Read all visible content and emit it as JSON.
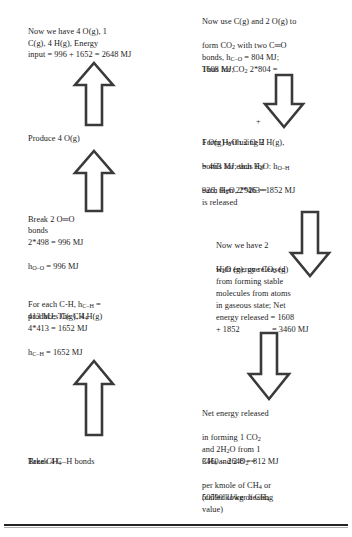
{
  "document": {
    "type": "bond-energy-flowchart",
    "page_background": "#ffffff",
    "ink_color": "#1d1d1d"
  },
  "left_column": {
    "blocks": [
      {
        "id": "energy-input-summary",
        "text": "Now we have 4 O(g), 1\nC(g), 4 H(g), Energy\ninput = 996 + 1652 = 2648 MJ"
      },
      {
        "id": "produce-oxygen",
        "text": "Produce 4 O(g)"
      },
      {
        "id": "break-oo-bonds-line1",
        "text": "Break 2 O═O"
      },
      {
        "id": "break-oo-bonds-line2",
        "text": "bonds"
      },
      {
        "id": "break-oo-bonds-line3",
        "text": "2*498 = 996 MJ"
      },
      {
        "id": "break-oo-bonds-line4",
        "text": "h",
        "subscript": "O–O",
        "tail": " = 996 MJ"
      },
      {
        "id": "ch-bond-line1a",
        "text": "For each C-H, h",
        "subscript": "C–H",
        "tail": " ="
      },
      {
        "id": "ch-bond-line2",
        "text": "413 MJ; The CH",
        "subscript": "4"
      },
      {
        "id": "ch-bond-line3",
        "text": "produces C(g), 4 H(g)"
      },
      {
        "id": "ch-bond-line4",
        "text": "4*413 = 1652 MJ"
      },
      {
        "id": "ch-bond-line5",
        "text": "h",
        "subscript": "C–H",
        "tail": " = 1652 MJ"
      },
      {
        "id": "take-methane-line1",
        "text": "Take CH",
        "subscript": "4"
      },
      {
        "id": "take-methane-line2",
        "text": "Break 4 C–H bonds"
      }
    ]
  },
  "right_column": {
    "blocks": [
      {
        "id": "form-co2-line1",
        "text": "Now use C(g) and 2 O(g) to"
      },
      {
        "id": "form-co2-line2",
        "text": "form CO",
        "subscript": "2",
        "tail": " with two C═O"
      },
      {
        "id": "form-co2-line3",
        "text": "bonds, h",
        "subscript": "C–O",
        "tail": " = 804 MJ;"
      },
      {
        "id": "form-co2-line4",
        "text": "Thus for CO",
        "subscript": "2",
        "tail": " 2*804 ="
      },
      {
        "id": "form-co2-line5",
        "text": "1608 MJ;"
      },
      {
        "id": "form-water-line1",
        "text": "Form H",
        "subscript": "2",
        "tail": "O using 2 H(g),"
      },
      {
        "id": "form-water-line2",
        "text": "1 O(g) with 2 O-H"
      },
      {
        "id": "form-water-line3",
        "text": "bonds for each H",
        "subscript": "2",
        "tail": "O: h",
        "subscript2": "O–H"
      },
      {
        "id": "form-water-line4",
        "text": "= 463 MJ; thus for"
      },
      {
        "id": "form-water-line5",
        "text": "each H",
        "subscript": "2",
        "tail": "O, 2*463 ="
      },
      {
        "id": "form-water-line6",
        "text": "926; then 2*926 = 1852 MJ"
      },
      {
        "id": "form-water-line7",
        "text": "is released"
      },
      {
        "id": "net-release-line1",
        "text": "Now we have 2"
      },
      {
        "id": "net-release-line2",
        "text": "H",
        "subscript": "2",
        "tail": "O (g), one CO",
        "subscript2": "2",
        "tail2": " (g)"
      },
      {
        "id": "net-release-line3",
        "text": "with energy released"
      },
      {
        "id": "net-release-line4",
        "text": "from forming stable"
      },
      {
        "id": "net-release-line5",
        "text": "molecules from atoms"
      },
      {
        "id": "net-release-line6",
        "text": "in gaseous state; Net"
      },
      {
        "id": "net-release-line7",
        "text": "energy released = 1608"
      },
      {
        "id": "net-release-line8-left",
        "text": "+ 1852"
      },
      {
        "id": "net-release-line8-right",
        "text": "= 3460 MJ"
      },
      {
        "id": "lhv-line1",
        "text": "Net energy released"
      },
      {
        "id": "lhv-line2",
        "text": "in forming 1 CO",
        "subscript": "2"
      },
      {
        "id": "lhv-line3",
        "text": "and 2H",
        "subscript": "2",
        "tail": "O from 1"
      },
      {
        "id": "lhv-line4",
        "text": "CH",
        "subscript": "4",
        "tail": " and 2 O",
        "subscript2": "2",
        "tail2": " ="
      },
      {
        "id": "lhv-line5",
        "text": "3460 – 2648 = 812 MJ"
      },
      {
        "id": "lhv-line6",
        "text": "per kmole of CH",
        "subscript": "4",
        "tail": " or"
      },
      {
        "id": "lhv-line7",
        "text": "50590 kJ/kg of CH",
        "subscript": "4"
      },
      {
        "id": "lhv-line8",
        "text": "(called lower heating"
      },
      {
        "id": "lhv-line9",
        "text": "value)"
      }
    ],
    "plus_sign": "+"
  },
  "arrows": {
    "left": [
      {
        "id": "arrow-up-energy-input",
        "direction": "up"
      },
      {
        "id": "arrow-up-produce-oxygen",
        "direction": "up"
      },
      {
        "id": "arrow-up-break-ch-bonds",
        "direction": "up"
      }
    ],
    "right": [
      {
        "id": "arrow-down-form-co2",
        "direction": "down"
      },
      {
        "id": "arrow-down-form-water",
        "direction": "down"
      },
      {
        "id": "arrow-down-net-energy",
        "direction": "down"
      }
    ],
    "stroke_color": "#3a3a3a",
    "fill_color": "#ffffff"
  },
  "footer": {
    "rule_color": "#242424"
  }
}
